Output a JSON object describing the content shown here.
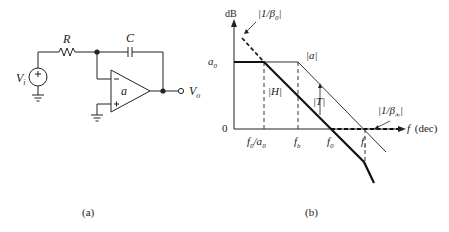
{
  "panel_a": {
    "caption": "(a)",
    "labels": {
      "resistor": "R",
      "capacitor": "C",
      "input": "V",
      "input_sub": "i",
      "output": "V",
      "output_sub": "o",
      "opamp_gain": "a",
      "inverting": "−",
      "noninverting": "+",
      "source_sign": "+"
    }
  },
  "panel_b": {
    "caption": "(b)",
    "y_axis_label": "dB",
    "x_axis_label": "f (dec)",
    "y_ticks": {
      "a0": "a",
      "a0_sub": "0",
      "zero": "0"
    },
    "x_ticks": {
      "f0_over_a0": "f",
      "f0_over_a0_sub": "0",
      "f0_over_a0_tail": "/a",
      "f0_over_a0_tail_sub": "0",
      "fb": "f",
      "fb_sub": "b",
      "f0": "f",
      "f0_sub": "0",
      "ft": "f",
      "ft_sub": "t"
    },
    "curve_labels": {
      "a": "|a|",
      "H": "|H|",
      "T": "|T|",
      "inv_beta0": "|1/β",
      "inv_beta0_sub": "0",
      "inv_beta_inf": "|1/β",
      "inv_beta_inf_sub": "∞"
    }
  }
}
